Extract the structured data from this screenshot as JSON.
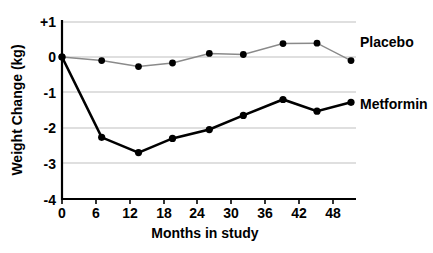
{
  "chart_data": {
    "type": "line",
    "title": "",
    "xlabel": "Months in study",
    "ylabel": "Weight Change (kg)",
    "xlim": [
      0,
      54
    ],
    "ylim": [
      -4,
      1
    ],
    "xticks": [
      0,
      6,
      12,
      18,
      24,
      30,
      36,
      42,
      48
    ],
    "xticklabels": [
      "0",
      "6",
      "12",
      "18",
      "24",
      "30",
      "36",
      "42",
      "48"
    ],
    "yticks": [
      1,
      0,
      -1,
      -2,
      -3,
      -4
    ],
    "yticklabels": [
      "+1",
      "0",
      "-1",
      "-2",
      "-3",
      "-4"
    ],
    "grid": "horizontal",
    "legend_position": "right-inline",
    "series": [
      {
        "name": "Placebo",
        "color": "#8a8a8a",
        "marker_color": "#000000",
        "x": [
          0,
          7,
          13.5,
          19.5,
          26,
          32,
          39,
          45,
          51
        ],
        "values": [
          0.0,
          -0.1,
          -0.27,
          -0.17,
          0.1,
          0.07,
          0.38,
          0.39,
          -0.1
        ]
      },
      {
        "name": "Metformin",
        "color": "#000000",
        "marker_color": "#000000",
        "x": [
          0,
          7,
          13.5,
          19.5,
          26,
          32,
          39,
          45,
          51
        ],
        "values": [
          0.0,
          -2.27,
          -2.7,
          -2.3,
          -2.05,
          -1.65,
          -1.2,
          -1.53,
          -1.28
        ]
      }
    ]
  },
  "labels": {
    "placebo": "Placebo",
    "metformin": "Metformin",
    "xlabel": "Months in study",
    "ylabel": "Weight Change (kg)"
  }
}
